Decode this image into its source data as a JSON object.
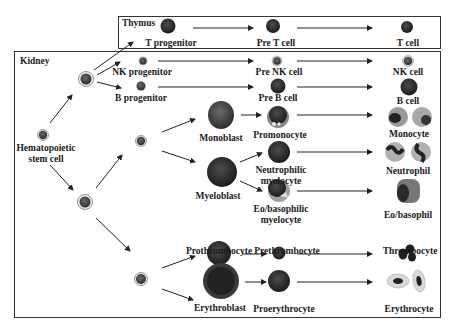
{
  "regions": {
    "thymus": {
      "label": "Thymus"
    },
    "kidney": {
      "label": "Kidney"
    }
  },
  "cells": {
    "hsc": {
      "label_line1": "Hematopoietic",
      "label_line2": "stem cell"
    },
    "t_progenitor": {
      "label": "T progenitor"
    },
    "pre_t_cell": {
      "label": "Pre T cell"
    },
    "t_cell": {
      "label": "T cell"
    },
    "nk_progenitor": {
      "label": "NK progenitor"
    },
    "pre_nk_cell": {
      "label": "Pre NK cell"
    },
    "nk_cell": {
      "label": "NK cell"
    },
    "b_progenitor": {
      "label": "B progenitor"
    },
    "pre_b_cell": {
      "label": "Pre B cell"
    },
    "b_cell": {
      "label": "B cell"
    },
    "monoblast": {
      "label": "Monoblast"
    },
    "promonocyte": {
      "label": "Promonocyte"
    },
    "monocyte": {
      "label": "Monocyte"
    },
    "myeloblast": {
      "label": "Myeloblast"
    },
    "neutrophilic_myelocyte": {
      "label_line1": "Neutrophilic",
      "label_line2": "myelocyte"
    },
    "neutrophil": {
      "label": "Neutrophil"
    },
    "eo_basophilic_myelocyte": {
      "label_line1": "Eo/basophilic",
      "label_line2": "myelocyte"
    },
    "eo_basophil": {
      "label": "Eo/basophil"
    },
    "prothrombocyte": {
      "label": "Prothrombocyte"
    },
    "prethrombocyte": {
      "label": "Prethrombocyte"
    },
    "thrombocyte": {
      "label": "Thrombocyte"
    },
    "erythroblast": {
      "label": "Erythroblast"
    },
    "proerythrocyte": {
      "label": "Proerythrocyte"
    },
    "erythrocyte": {
      "label": "Erythrocyte"
    }
  },
  "colors": {
    "border": "#333333",
    "arrow": "#222222",
    "cell_dark": "#2a2a2a",
    "cell_mid": "#4a4a4a",
    "cell_halo": "#9a9a9a",
    "cytoplasm": "#b8b8b8"
  }
}
